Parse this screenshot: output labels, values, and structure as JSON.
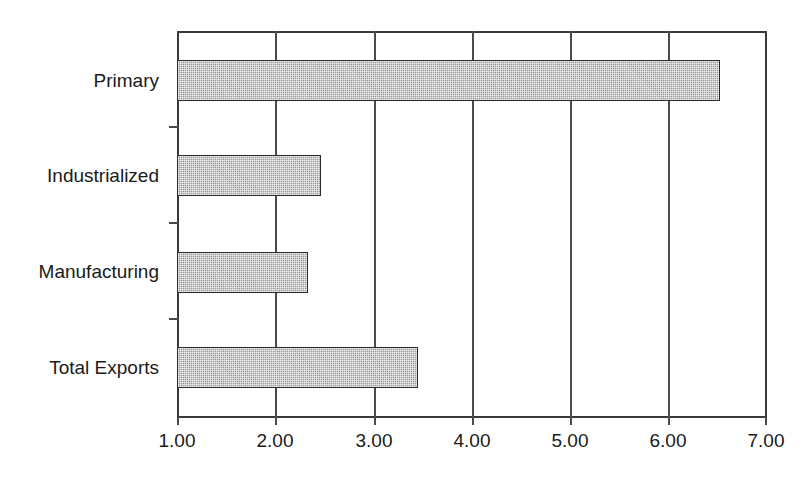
{
  "chart_data": {
    "type": "bar",
    "orientation": "horizontal",
    "title": "",
    "subtitle": "",
    "xlabel": "",
    "ylabel": "",
    "categories": [
      "Primary",
      "Industrialized",
      "Manufacturing",
      "Total Exports"
    ],
    "values": [
      6.52,
      2.46,
      2.33,
      3.45
    ],
    "series": [
      {
        "name": "",
        "values": [
          6.52,
          2.46,
          2.33,
          3.45
        ]
      }
    ],
    "xlim": [
      1.0,
      7.0
    ],
    "xticks": [
      1.0,
      2.0,
      3.0,
      4.0,
      5.0,
      6.0,
      7.0
    ],
    "xticklabels": [
      "1.00",
      "2.00",
      "3.00",
      "4.00",
      "5.00",
      "6.00",
      "7.00"
    ],
    "grid": true,
    "grid_axis": "x",
    "legend": false,
    "legend_position": "none",
    "bar_fill_color": "#9d9d9d",
    "bar_edge_color": "#2b2b2b",
    "axis_color": "#3a3a3a",
    "background_color": "#ffffff",
    "annotations": []
  },
  "axis": {
    "tick_labels": [
      {
        "text": "1.00",
        "value": 1.0
      },
      {
        "text": "2.00",
        "value": 2.0
      },
      {
        "text": "3.00",
        "value": 3.0
      },
      {
        "text": "4.00",
        "value": 4.0
      },
      {
        "text": "5.00",
        "value": 5.0
      },
      {
        "text": "6.00",
        "value": 6.0
      },
      {
        "text": "7.00",
        "value": 7.0
      }
    ]
  },
  "categories": [
    {
      "label": "Primary",
      "value": 6.52
    },
    {
      "label": "Industrialized",
      "value": 2.46
    },
    {
      "label": "Manufacturing",
      "value": 2.33
    },
    {
      "label": "Total Exports",
      "value": 3.45
    }
  ]
}
